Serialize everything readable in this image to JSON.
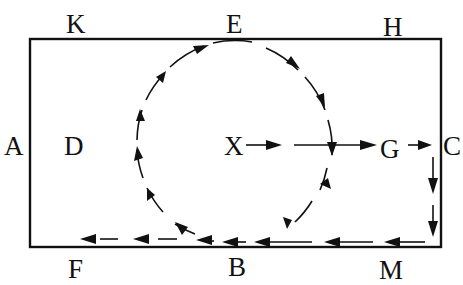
{
  "diagram": {
    "type": "flow-path diagram",
    "colors": {
      "ink": "#111111",
      "background": "#ffffff"
    },
    "labels": {
      "K": "K",
      "E": "E",
      "H": "H",
      "A": "A",
      "D": "D",
      "X": "X",
      "G": "G",
      "C": "C",
      "F": "F",
      "B": "B",
      "M": "M"
    },
    "paths": [
      {
        "name": "circular-loop",
        "direction": "clockwise",
        "from": "X-line",
        "via": [
          "B",
          "D",
          "E"
        ],
        "style": "dashed-arrows"
      },
      {
        "name": "straight-path",
        "from": "X",
        "to": "G",
        "then": "C",
        "style": "arrows"
      },
      {
        "name": "right-edge-path",
        "from": "C",
        "to": "M",
        "style": "dashed-arrows-down"
      },
      {
        "name": "bottom-edge-path",
        "from": "M",
        "to": "F",
        "via": [
          "B"
        ],
        "style": "dashed-arrows-left"
      }
    ]
  }
}
